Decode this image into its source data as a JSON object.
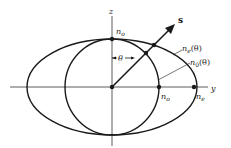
{
  "diagram": {
    "colors": {
      "stroke": "#1a1a1a",
      "axis": "#333333",
      "background": "#ffffff"
    },
    "axes": {
      "horizontal_label": "y",
      "vertical_label": "z"
    },
    "vector": {
      "label": "s"
    },
    "angle": {
      "label": "θ"
    },
    "labels": {
      "n_o_top": "n",
      "n_o_top_sub": "o",
      "n_o_axis": "n",
      "n_o_axis_sub": "o",
      "n_e_axis": "n",
      "n_e_axis_sub": "e",
      "n_e_theta": "n",
      "n_e_theta_sub": "e",
      "n_e_theta_arg": "(θ)",
      "n_0_theta": "n",
      "n_0_theta_sub": "0",
      "n_0_theta_arg": "(θ)"
    },
    "curves": [
      {
        "name": "extraordinary-ellipse",
        "label": "n_e(θ)"
      },
      {
        "name": "ordinary-circle",
        "label": "n_0(θ)"
      }
    ]
  }
}
